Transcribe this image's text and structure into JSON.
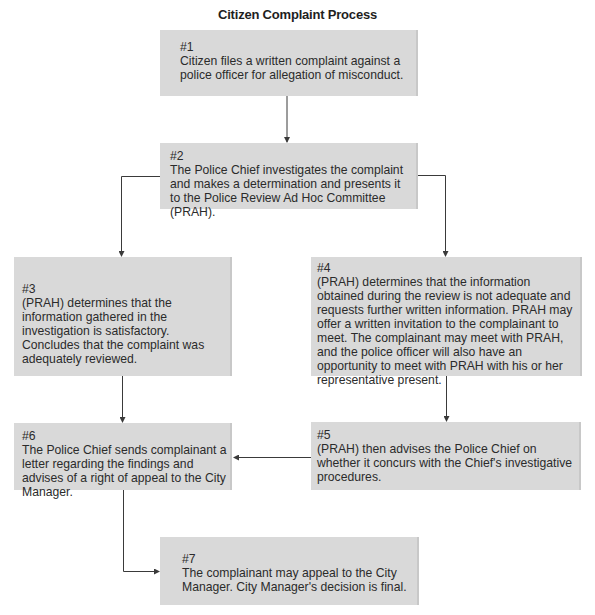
{
  "title": "Citizen Complaint Process",
  "colors": {
    "box_fill": "#d9d9d9",
    "line": "#3a3a3a",
    "text": "#2b2b2b"
  },
  "steps": [
    {
      "id": "1",
      "number": "#1",
      "text": "Citizen files a written complaint against a police officer for allegation of misconduct."
    },
    {
      "id": "2",
      "number": "#2",
      "text": "The Police Chief investigates the complaint and makes a determination and presents it to the Police Review Ad Hoc Committee (PRAH)."
    },
    {
      "id": "3",
      "number": "#3",
      "text": "(PRAH) determines that the information gathered in the investigation is satisfactory. Concludes that the complaint was adequately reviewed."
    },
    {
      "id": "4",
      "number": "#4",
      "text": "(PRAH) determines that the information obtained during the review is not adequate and requests further written information. PRAH may offer a written invitation to the complainant to meet. The complainant may meet with PRAH, and the police officer will also have an opportunity to meet with PRAH with his or her representative present."
    },
    {
      "id": "5",
      "number": "#5",
      "text": "(PRAH) then advises the Police Chief on whether it concurs with the Chief's investigative procedures."
    },
    {
      "id": "6",
      "number": "#6",
      "text": "The Police Chief sends complainant a letter regarding the findings and advises of a right of appeal to the City Manager."
    },
    {
      "id": "7",
      "number": "#7",
      "text": "The complainant may appeal to the City Manager. City Manager's decision is final."
    }
  ],
  "edges": [
    {
      "from": "#1",
      "to": "#2"
    },
    {
      "from": "#2",
      "to": "#3"
    },
    {
      "from": "#2",
      "to": "#4"
    },
    {
      "from": "#3",
      "to": "#6"
    },
    {
      "from": "#4",
      "to": "#5"
    },
    {
      "from": "#5",
      "to": "#6"
    },
    {
      "from": "#6",
      "to": "#7"
    }
  ]
}
